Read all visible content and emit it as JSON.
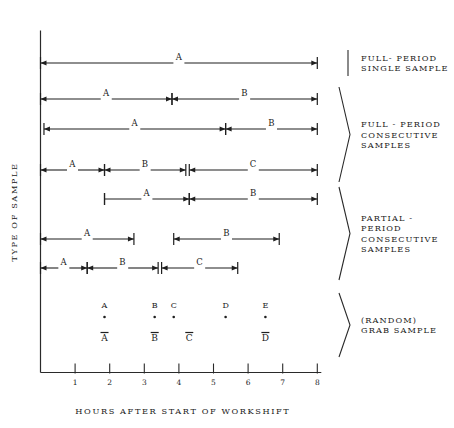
{
  "figure": {
    "y_axis_title": "TYPE OF SAMPLE",
    "x_axis_title": "HOURS AFTER START OF WORKSHIFT"
  },
  "chart_data": {
    "type": "table",
    "title": "",
    "xlabel": "HOURS AFTER START OF WORKSHIFT",
    "ylabel": "TYPE OF SAMPLE",
    "xlim": [
      0,
      8
    ],
    "xticks": [
      1,
      2,
      3,
      4,
      5,
      6,
      7,
      8
    ],
    "xtick_labels": [
      "1",
      "2",
      "3",
      "4",
      "5",
      "6",
      "7",
      "8"
    ],
    "grid": false,
    "legend": "right-side group braces",
    "groups": [
      {
        "name": "FULL- PERIOD\nSINGLE SAMPLE",
        "label_lines": [
          "FULL- PERIOD",
          "SINGLE SAMPLE"
        ],
        "bracket": "bar",
        "rows": [
          {
            "row": 1,
            "segments": [
              {
                "label": "A",
                "start": 0.0,
                "end": 8.0,
                "left_cap": "arrow",
                "right_cap": "arrow"
              }
            ]
          }
        ]
      },
      {
        "name": "FULL - PERIOD CONSECUTIVE SAMPLES",
        "label_lines": [
          "FULL - PERIOD",
          "CONSECUTIVE",
          "SAMPLES"
        ],
        "bracket": "brace",
        "rows": [
          {
            "row": 2,
            "segments": [
              {
                "label": "A",
                "start": 0.0,
                "end": 3.8,
                "left_cap": "arrow",
                "right_cap": "arrow"
              },
              {
                "label": "B",
                "start": 3.8,
                "end": 8.0,
                "left_cap": "arrow",
                "right_cap": "arrow"
              }
            ]
          },
          {
            "row": 3,
            "segments": [
              {
                "label": "A",
                "start": 0.1,
                "end": 5.35,
                "left_cap": "arrow",
                "right_cap": "arrow"
              },
              {
                "label": "B",
                "start": 5.35,
                "end": 8.0,
                "left_cap": "arrow",
                "right_cap": "arrow"
              }
            ]
          },
          {
            "row": 4,
            "segments": [
              {
                "label": "A",
                "start": 0.0,
                "end": 1.85,
                "left_cap": "arrow",
                "right_cap": "arrow"
              },
              {
                "label": "B",
                "start": 1.85,
                "end": 4.2,
                "left_cap": "arrow",
                "right_cap": "arrow"
              },
              {
                "label": "C",
                "start": 4.3,
                "end": 8.0,
                "left_cap": "arrow",
                "right_cap": "arrow"
              }
            ]
          }
        ]
      },
      {
        "name": "PARTIAL - PERIOD CONSECUTIVE SAMPLES",
        "label_lines": [
          "PARTIAL -",
          "PERIOD",
          "CONSECUTIVE",
          "SAMPLES"
        ],
        "bracket": "brace",
        "rows": [
          {
            "row": 5,
            "segments": [
              {
                "label": "A",
                "start": 1.85,
                "end": 4.3,
                "left_cap": "tick",
                "right_cap": "arrow"
              },
              {
                "label": "B",
                "start": 4.3,
                "end": 8.0,
                "left_cap": "arrow",
                "right_cap": "arrow"
              }
            ]
          },
          {
            "row": 6,
            "segments": [
              {
                "label": "A",
                "start": 0.0,
                "end": 2.7,
                "left_cap": "arrow",
                "right_cap": "arrow"
              },
              {
                "label": "B",
                "start": 3.85,
                "end": 6.9,
                "left_cap": "arrow",
                "right_cap": "arrow"
              }
            ]
          },
          {
            "row": 7,
            "segments": [
              {
                "label": "A",
                "start": 0.0,
                "end": 1.35,
                "left_cap": "arrow",
                "right_cap": "arrow"
              },
              {
                "label": "B",
                "start": 1.35,
                "end": 3.4,
                "left_cap": "arrow",
                "right_cap": "arrow"
              },
              {
                "label": "C",
                "start": 3.5,
                "end": 5.7,
                "left_cap": "arrow",
                "right_cap": "arrow"
              }
            ]
          }
        ]
      },
      {
        "name": "(RANDOM) GRAB SAMPLE",
        "label_lines": [
          "(RANDOM)",
          "GRAB SAMPLE"
        ],
        "bracket": "brace",
        "rows": [
          {
            "row": 8,
            "points": [
              {
                "label": "A",
                "x": 1.85
              },
              {
                "label": "B",
                "x": 3.3
              },
              {
                "label": "C",
                "x": 3.85
              },
              {
                "label": "D",
                "x": 5.35
              },
              {
                "label": "E",
                "x": 6.5
              }
            ],
            "means": [
              {
                "label": "A",
                "x": 1.85
              },
              {
                "label": "B",
                "x": 3.3
              },
              {
                "label": "C",
                "x": 4.3
              },
              {
                "label": "D",
                "x": 6.5
              }
            ]
          }
        ]
      }
    ]
  }
}
